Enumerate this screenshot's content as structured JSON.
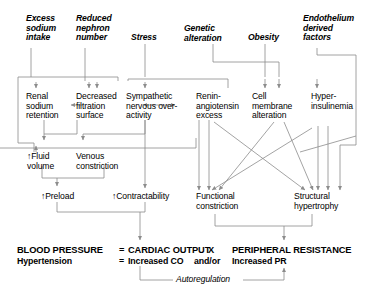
{
  "diagram": {
    "line_color": "#8c8c8c",
    "text_color": "#000000",
    "background": "#ffffff"
  },
  "sources": [
    {
      "id": "excess-sodium-intake",
      "lines": [
        "Excess",
        "sodium",
        "intake"
      ]
    },
    {
      "id": "reduced-nephron-number",
      "lines": [
        "Reduced",
        "nephron",
        "number"
      ]
    },
    {
      "id": "stress",
      "lines": [
        "Stress"
      ]
    },
    {
      "id": "genetic-alteration",
      "lines": [
        "Genetic",
        "alteration"
      ]
    },
    {
      "id": "obesity",
      "lines": [
        "Obesity"
      ]
    },
    {
      "id": "endothelium-derived-factors",
      "lines": [
        "Endothelium",
        "derived",
        "factors"
      ]
    }
  ],
  "mediators": [
    {
      "id": "renal-sodium-retention",
      "lines": [
        "Renal",
        "sodium",
        "retention"
      ]
    },
    {
      "id": "decreased-filtration-surface",
      "lines": [
        "Decreased",
        "filtration",
        "surface"
      ]
    },
    {
      "id": "sympathetic-nervous-overactivity",
      "lines": [
        "Sympathetic",
        "nervous over-",
        "activity"
      ]
    },
    {
      "id": "renin-angiotensin-excess",
      "lines": [
        "Renin-",
        "angiotensin",
        "excess"
      ]
    },
    {
      "id": "cell-membrane-alteration",
      "lines": [
        "Cell",
        "membrane",
        "alteration"
      ]
    },
    {
      "id": "hyperinsulinemia",
      "lines": [
        "Hyper-",
        "insulinemia"
      ]
    }
  ],
  "intermediates": [
    {
      "id": "fluid-volume",
      "lines": [
        "↑Fluid",
        "volume"
      ]
    },
    {
      "id": "venous-constriction",
      "lines": [
        "Venous",
        "constriction"
      ]
    },
    {
      "id": "preload",
      "lines": [
        "↑Preload"
      ]
    },
    {
      "id": "contractability",
      "lines": [
        "↑Contractability"
      ]
    },
    {
      "id": "functional-constriction",
      "lines": [
        "Functional",
        "constriction"
      ]
    },
    {
      "id": "structural-hypertrophy",
      "lines": [
        "Structural",
        "hypertrophy"
      ]
    }
  ],
  "equation": {
    "row1": {
      "left": "BLOOD PRESSURE",
      "equals": "=",
      "middle": "CARDIAC OUTPUT",
      "operator": "X",
      "right": "PERIPHERAL RESISTANCE"
    },
    "row2": {
      "left": "Hypertension",
      "equals": "=",
      "middle": "Increased CO",
      "operator": "and/or",
      "right": "Increased PR"
    },
    "feedback_label": "Autoregulation"
  }
}
